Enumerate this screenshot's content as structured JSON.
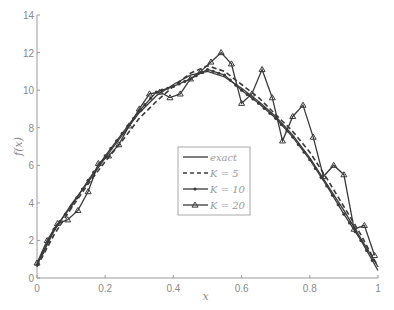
{
  "chart_data": {
    "type": "line",
    "title": "",
    "xlabel": "x",
    "ylabel": "f(x)",
    "xlim": [
      0,
      1
    ],
    "ylim": [
      0,
      14
    ],
    "xticks": [
      "0",
      "0.2",
      "0.4",
      "0.6",
      "0.8",
      "1"
    ],
    "yticks": [
      "0",
      "2",
      "4",
      "6",
      "8",
      "10",
      "12",
      "14"
    ],
    "grid": false,
    "legend_position": "center-right inside axes",
    "legend": [
      "exact",
      "K = 5",
      "K = 10",
      "K = 20"
    ],
    "series": [
      {
        "name": "exact",
        "style": "solid",
        "x": [
          0,
          0.05,
          0.1,
          0.15,
          0.2,
          0.25,
          0.3,
          0.35,
          0.4,
          0.45,
          0.5,
          0.55,
          0.6,
          0.65,
          0.7,
          0.75,
          0.8,
          0.85,
          0.9,
          0.95,
          1.0
        ],
        "y": [
          0.7,
          2.5,
          3.9,
          5.1,
          6.4,
          7.6,
          8.8,
          9.7,
          10.3,
          10.8,
          11.0,
          10.7,
          10.1,
          9.4,
          8.6,
          7.6,
          6.4,
          5.0,
          3.6,
          2.1,
          0.6
        ]
      },
      {
        "name": "K = 5",
        "style": "dashed",
        "x": [
          0,
          0.05,
          0.1,
          0.15,
          0.2,
          0.25,
          0.3,
          0.35,
          0.4,
          0.45,
          0.5,
          0.55,
          0.6,
          0.65,
          0.7,
          0.75,
          0.8,
          0.85,
          0.9,
          0.95,
          1.0
        ],
        "y": [
          0.6,
          2.3,
          3.7,
          5.0,
          6.2,
          7.3,
          8.5,
          9.4,
          10.2,
          10.9,
          11.3,
          11.0,
          10.3,
          9.6,
          8.7,
          7.8,
          6.7,
          5.3,
          3.8,
          2.3,
          0.6
        ]
      },
      {
        "name": "K = 10",
        "style": "solid with dot markers",
        "x": [
          0,
          0.05,
          0.1,
          0.15,
          0.2,
          0.25,
          0.3,
          0.35,
          0.4,
          0.45,
          0.5,
          0.55,
          0.6,
          0.65,
          0.7,
          0.75,
          0.8,
          0.85,
          0.9,
          0.95,
          1.0
        ],
        "y": [
          0.7,
          2.6,
          3.8,
          5.2,
          6.5,
          7.7,
          8.9,
          9.9,
          10.2,
          10.6,
          11.1,
          10.8,
          10.0,
          9.3,
          8.5,
          7.5,
          6.3,
          4.9,
          3.4,
          2.0,
          0.4
        ]
      },
      {
        "name": "K = 20",
        "style": "solid with triangle markers",
        "x": [
          0,
          0.03,
          0.06,
          0.09,
          0.12,
          0.15,
          0.18,
          0.21,
          0.24,
          0.27,
          0.3,
          0.33,
          0.36,
          0.39,
          0.42,
          0.45,
          0.48,
          0.51,
          0.54,
          0.57,
          0.6,
          0.63,
          0.66,
          0.69,
          0.72,
          0.75,
          0.78,
          0.81,
          0.84,
          0.87,
          0.9,
          0.93,
          0.96,
          0.99
        ],
        "y": [
          0.8,
          2.0,
          2.9,
          3.1,
          3.6,
          4.6,
          6.1,
          6.5,
          7.1,
          8.1,
          9.0,
          9.8,
          9.9,
          9.6,
          9.8,
          10.6,
          11.0,
          11.5,
          12.0,
          11.4,
          9.3,
          9.8,
          11.1,
          9.6,
          7.3,
          8.6,
          9.2,
          7.5,
          5.4,
          6.0,
          5.5,
          2.6,
          2.8,
          1.2
        ]
      }
    ]
  }
}
